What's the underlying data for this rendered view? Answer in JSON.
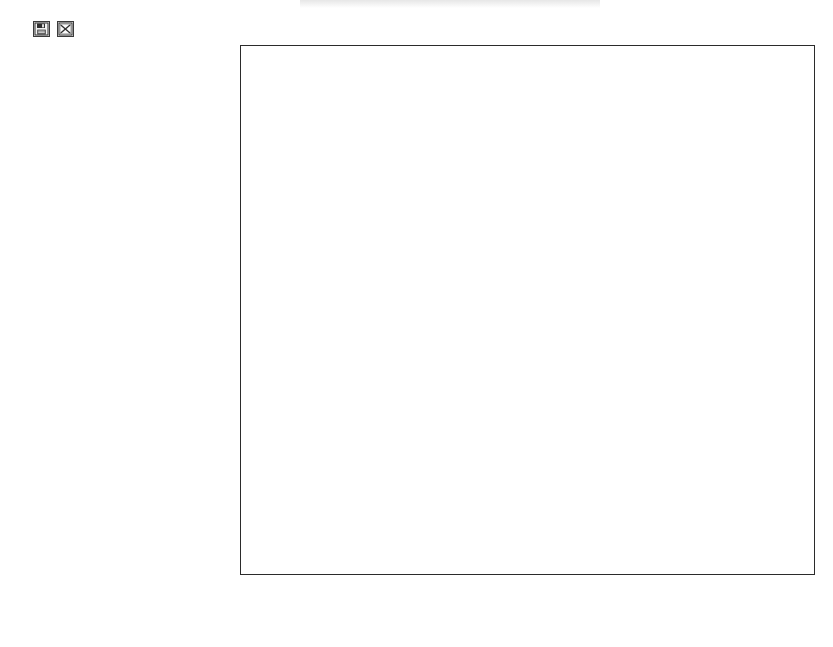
{
  "header": {
    "icons": [
      {
        "name": "save-icon",
        "label": "save"
      },
      {
        "name": "chart-icon",
        "label": "chart"
      }
    ]
  },
  "footer": {
    "copyright": "© BenchmarkPortal, Inc."
  },
  "colors": {
    "top_box": "#d4d4d4",
    "bottom_box": "#8a8a8a",
    "axis": "#2b2b2b",
    "grid": "#bdbdbd",
    "text": "#111111"
  },
  "chart_data": {
    "type": "bar",
    "orientation": "horizontal",
    "xlabel": "",
    "ylabel": "",
    "xlim": [
      0,
      32
    ],
    "xticks": [
      "0",
      "8",
      "16",
      "24",
      "32"
    ],
    "grid": true,
    "legend": "none",
    "categories": [
      "Belongingness",
      "Supervisor Style",
      "Overall",
      "Training/Promotions",
      "Leadership/Trust",
      "Expectations/Compensation",
      "Value/Appreciation",
      "Customer-Focus",
      "Innovation/Involvement",
      "Resources/Technology",
      "Vision",
      "Coaching",
      "Work Schedule",
      "Recognition",
      "Work Environment",
      "Customer Direct",
      "Quality Processes",
      "Communication"
    ],
    "series": [
      {
        "name": "Top box",
        "values": [
          25,
          25,
          23.38,
          22.73,
          22.73,
          23.86,
          20.91,
          23.11,
          20.45,
          20,
          19.89,
          19.81,
          19.09,
          18.75,
          13.64,
          17.05,
          14.09,
          31.82
        ],
        "labels": [
          "25%",
          "25%",
          "23.38%",
          "22.73%",
          "22.73%",
          "23.86%",
          "20.91%",
          "23.11%",
          "20.45%",
          "20%",
          "19.89%",
          "19.81%",
          "19.09%",
          "18.75%",
          "13.64%",
          "17.05%",
          "14.09%",
          "31.82%"
        ]
      },
      {
        "name": "Bottom box",
        "values": [
          null,
          null,
          null,
          null,
          null,
          2.27,
          null,
          2.27,
          null,
          null,
          null,
          null,
          null,
          null,
          null,
          3.98,
          9.09,
          10
        ],
        "labels": [
          null,
          null,
          null,
          null,
          null,
          "2.27%",
          null,
          "2.27%",
          null,
          null,
          null,
          null,
          null,
          null,
          null,
          "3.98%",
          "9.09%",
          "10%"
        ]
      }
    ]
  }
}
